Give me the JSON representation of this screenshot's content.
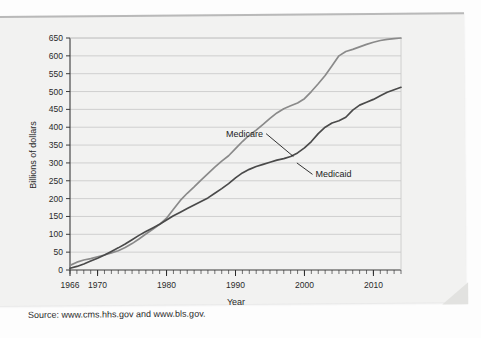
{
  "page": {
    "source_note": "Source: www.cms.hhs.gov and www.bls.gov.",
    "ghost_marginalia": ""
  },
  "chart_data": {
    "type": "line",
    "title": "",
    "xlabel": "Year",
    "ylabel": "Billions of dollars",
    "xlim": [
      1966,
      2014
    ],
    "ylim": [
      0,
      650
    ],
    "ytick_step": 50,
    "yticks": [
      0,
      50,
      100,
      150,
      200,
      250,
      300,
      350,
      400,
      450,
      500,
      550,
      600,
      650
    ],
    "xticks": [
      1966,
      1970,
      1980,
      1990,
      2000,
      2010
    ],
    "xtick_labels": [
      "1966",
      "1970",
      "1980",
      "1990",
      "2000",
      "2010"
    ],
    "minor_xtick_every": 1,
    "grid": "horizontal",
    "legend_position": "inline-annotations",
    "annotations": [
      {
        "text": "Medicare",
        "x": 1994.0,
        "y": 382,
        "leader_to_x": 1998.4,
        "leader_to_y": 318
      },
      {
        "text": "Medicaid",
        "x": 2001.6,
        "y": 268,
        "leader_to_x": 1998.9,
        "leader_to_y": 300
      }
    ],
    "x": [
      1966,
      1967,
      1968,
      1969,
      1970,
      1971,
      1972,
      1973,
      1974,
      1975,
      1976,
      1977,
      1978,
      1979,
      1980,
      1981,
      1982,
      1983,
      1984,
      1985,
      1986,
      1987,
      1988,
      1989,
      1990,
      1991,
      1992,
      1993,
      1994,
      1995,
      1996,
      1997,
      1998,
      1999,
      2000,
      2001,
      2002,
      2003,
      2004,
      2005,
      2006,
      2007,
      2008,
      2009,
      2010,
      2011,
      2012,
      2013,
      2014
    ],
    "series": [
      {
        "name": "Medicare",
        "color": "#8a8a8a",
        "values": [
          13,
          22,
          28,
          32,
          37,
          42,
          48,
          54,
          63,
          74,
          87,
          101,
          114,
          128,
          145,
          170,
          195,
          215,
          233,
          252,
          270,
          288,
          305,
          320,
          340,
          360,
          378,
          392,
          408,
          425,
          440,
          452,
          460,
          468,
          480,
          500,
          522,
          545,
          572,
          600,
          612,
          618,
          625,
          632,
          638,
          643,
          646,
          648,
          650
        ]
      },
      {
        "name": "Medicaid",
        "color": "#4a4a4a",
        "values": [
          5,
          10,
          17,
          25,
          33,
          42,
          52,
          62,
          73,
          85,
          97,
          108,
          118,
          128,
          140,
          152,
          162,
          172,
          182,
          192,
          202,
          215,
          228,
          242,
          258,
          272,
          282,
          290,
          296,
          302,
          308,
          312,
          318,
          328,
          342,
          360,
          382,
          400,
          412,
          418,
          428,
          448,
          462,
          470,
          478,
          488,
          498,
          505,
          512
        ]
      }
    ]
  }
}
